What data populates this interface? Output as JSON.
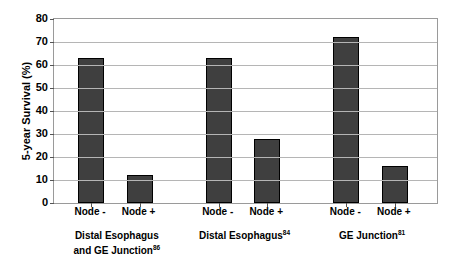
{
  "chart_data": {
    "type": "bar",
    "title": "",
    "xlabel": "",
    "ylabel": "5-year Survival (%)",
    "ylim": [
      0,
      80
    ],
    "ytick_step": 10,
    "yticks": [
      "80",
      "70",
      "60",
      "50",
      "40",
      "30",
      "20",
      "10",
      "0"
    ],
    "grid": true,
    "legend": "none",
    "bar_color": "#3f3f3f",
    "bar_border_color": "#000000",
    "gridline_color": "#b5b5b5",
    "axis_color": "#9a9a9a",
    "categories": [
      "Node -",
      "Node +",
      "Node -",
      "Node +",
      "Node -",
      "Node +"
    ],
    "values": [
      63,
      12,
      63,
      28,
      72,
      16
    ],
    "groups": [
      {
        "label_line1": "Distal Esophagus",
        "label_line2": "and GE Junction",
        "reference": "86",
        "bars": [
          {
            "category": "Node -",
            "value": 63
          },
          {
            "category": "Node +",
            "value": 12
          }
        ]
      },
      {
        "label_line1": "Distal Esophagus",
        "label_line2": "",
        "reference": "84",
        "bars": [
          {
            "category": "Node -",
            "value": 63
          },
          {
            "category": "Node +",
            "value": 28
          }
        ]
      },
      {
        "label_line1": "GE Junction",
        "label_line2": "",
        "reference": "81",
        "bars": [
          {
            "category": "Node -",
            "value": 72
          },
          {
            "category": "Node +",
            "value": 16
          }
        ]
      }
    ]
  }
}
